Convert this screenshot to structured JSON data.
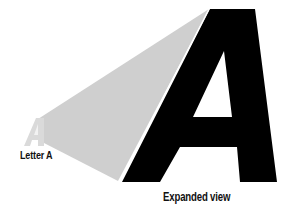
{
  "diagram": {
    "colors": {
      "wedge": "#cfcfcf",
      "small_letter": "#d4d4d4",
      "big_letter": "#000000",
      "text": "#111111"
    },
    "small_letter": {
      "glyph": "A",
      "label": "Letter A"
    },
    "expanded": {
      "glyph": "A",
      "label": "Expanded view"
    }
  }
}
